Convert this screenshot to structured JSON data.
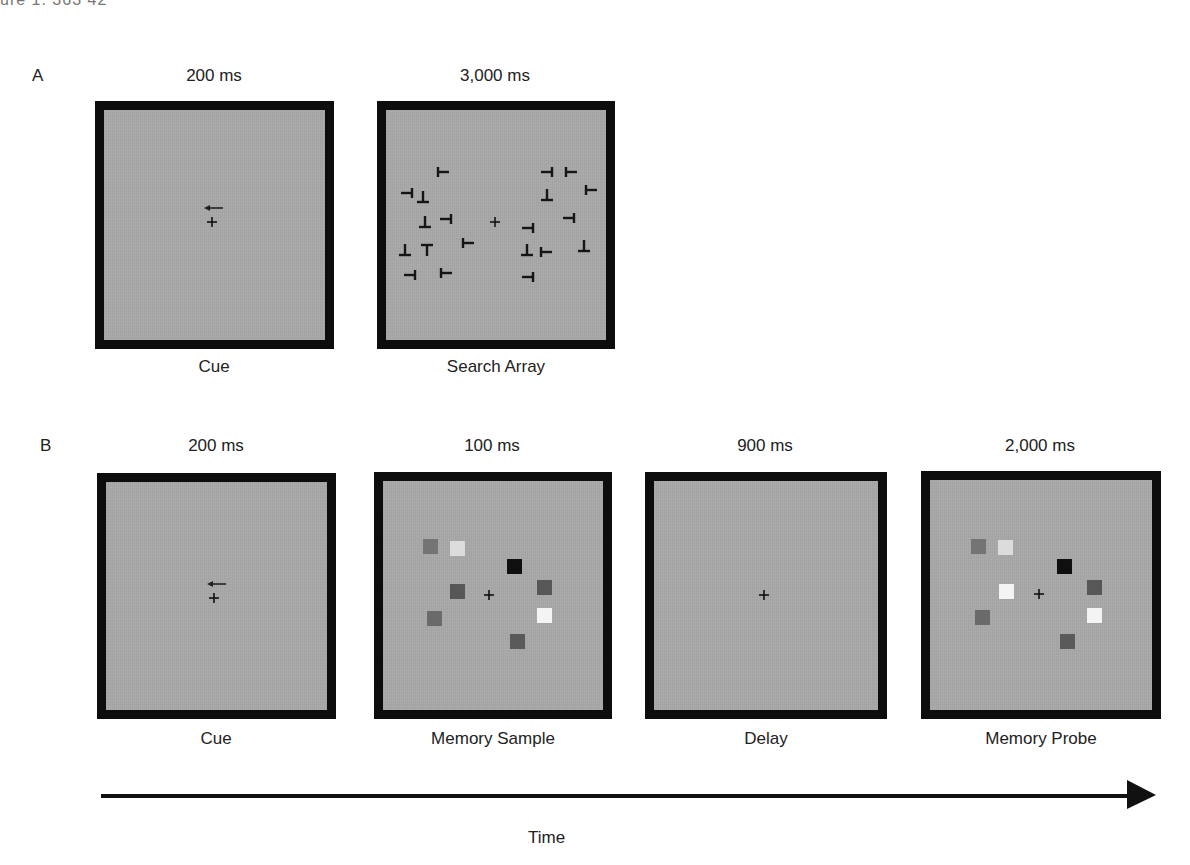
{
  "header": {
    "clipped_text": "ure 1. 363 42"
  },
  "sections": {
    "A": {
      "label": "A",
      "panels": [
        {
          "duration": "200 ms",
          "caption": "Cue",
          "content": "left-arrow cue above fixation cross"
        },
        {
          "duration": "3,000 ms",
          "caption": "Search Array",
          "content": "T and L-like rotated letters around fixation cross"
        }
      ]
    },
    "B": {
      "label": "B",
      "panels": [
        {
          "duration": "200 ms",
          "caption": "Cue",
          "content": "left-arrow cue above fixation cross"
        },
        {
          "duration": "100 ms",
          "caption": "Memory Sample",
          "content": "colored squares around fixation"
        },
        {
          "duration": "900 ms",
          "caption": "Delay",
          "content": "fixation cross only"
        },
        {
          "duration": "2,000 ms",
          "caption": "Memory Probe",
          "content": "colored squares around fixation (one changed)"
        }
      ]
    }
  },
  "timeline": {
    "label": "Time"
  },
  "colors": {
    "panel_border": "#0d0d0d",
    "panel_background": "#a9a9a9",
    "square_medium": "#747474",
    "square_light": "#dcdcdc",
    "square_black": "#0f0f0f",
    "square_dark": "#575757",
    "square_white": "#f4f4f4"
  }
}
